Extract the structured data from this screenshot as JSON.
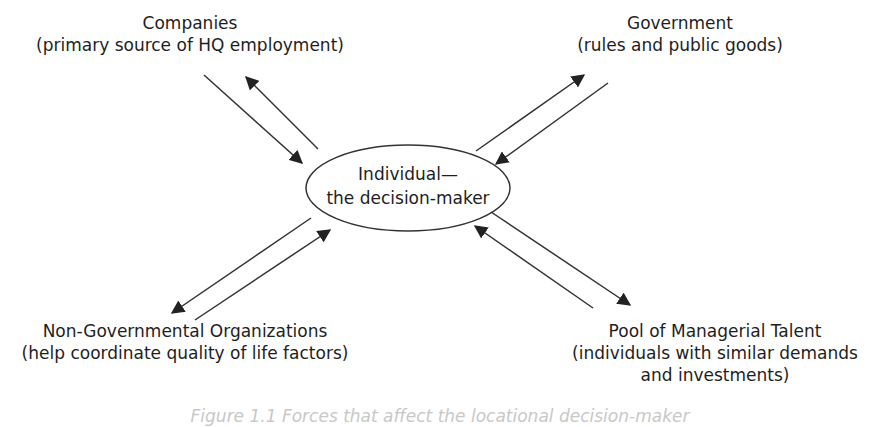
{
  "diagram": {
    "center": {
      "line1": "Individual—",
      "line2": "the decision-maker"
    },
    "nodes": {
      "companies": {
        "title": "Companies",
        "subtitle": "(primary source of HQ employment)"
      },
      "government": {
        "title": "Government",
        "subtitle": "(rules and public goods)"
      },
      "ngo": {
        "title": "Non-Governmental Organizations",
        "subtitle": "(help coordinate quality of life factors)"
      },
      "pool": {
        "title": "Pool of Managerial Talent",
        "subtitle": "(individuals with similar demands",
        "subtitle2": "and investments)"
      }
    },
    "edges": [
      {
        "from": "companies",
        "to": "individual",
        "bidirectional": true
      },
      {
        "from": "government",
        "to": "individual",
        "bidirectional": true
      },
      {
        "from": "ngo",
        "to": "individual",
        "bidirectional": true
      },
      {
        "from": "pool",
        "to": "individual",
        "bidirectional": true
      }
    ],
    "caption": "Figure 1.1 Forces that affect the locational decision-maker",
    "colors": {
      "stroke": "#222222",
      "text": "#1e1e1e",
      "background": "#ffffff"
    }
  }
}
